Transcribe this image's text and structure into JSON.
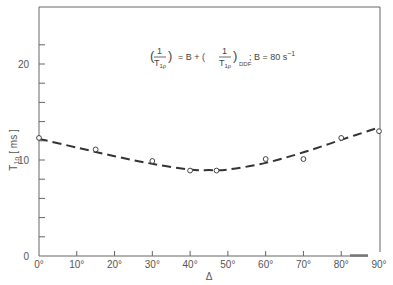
{
  "chart_data": {
    "type": "scatter",
    "title": "",
    "annotation": {
      "lhs_num": "1",
      "lhs_den": "T",
      "lhs_den_sub": "1ρ",
      "equals": "= B + (",
      "rhs_num": "1",
      "rhs_den": "T",
      "rhs_den_sub": "1ρ",
      "rhs_sub": "DDF",
      "tail": "; B = 80 s",
      "tail_sup": "−1"
    },
    "xlabel": "Δ",
    "ylabel": "T1ρ [ms]",
    "ylabel_main": "T",
    "ylabel_sub": "1ρ",
    "ylabel_unit": "[ ms ]",
    "xlim": [
      0,
      90
    ],
    "ylim": [
      0,
      25
    ],
    "x_ticks": [
      "0°",
      "10°",
      "20°",
      "30°",
      "40°",
      "50°",
      "60°",
      "70°",
      "80°",
      "90°"
    ],
    "y_ticks": [
      "0",
      "10",
      "20"
    ],
    "y_minor_tick_step": 2,
    "grid": false,
    "series": [
      {
        "name": "measured",
        "marker": "open-circle",
        "x": [
          0,
          15,
          30,
          40,
          47,
          60,
          70,
          80,
          90
        ],
        "y": [
          12.3,
          11.1,
          9.9,
          8.9,
          8.9,
          10.1,
          10.1,
          12.3,
          13.0
        ]
      },
      {
        "name": "fit (dashed)",
        "style": "dashed",
        "x": [
          0,
          10,
          20,
          30,
          40,
          45,
          50,
          60,
          70,
          80,
          90
        ],
        "y": [
          12.2,
          11.3,
          10.4,
          9.6,
          9.0,
          8.95,
          9.0,
          9.7,
          10.8,
          12.1,
          13.4
        ]
      }
    ]
  }
}
